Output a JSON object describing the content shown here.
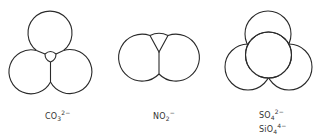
{
  "figure": {
    "type": "space-filling models of oxyanions",
    "panels": [
      {
        "id": "carbonate",
        "geometry": "trigonal planar",
        "label": {
          "base": "CO",
          "sub": "3",
          "sup": "2−"
        },
        "atoms": [
          {
            "element": "O",
            "cx": 50,
            "cy": 33,
            "r": 22
          },
          {
            "element": "O",
            "cx": 30,
            "cy": 68,
            "r": 22
          },
          {
            "element": "O",
            "cx": 71,
            "cy": 68,
            "r": 22
          },
          {
            "element": "C",
            "cx": 50.5,
            "cy": 56,
            "r": 5,
            "note": "central atom visible"
          }
        ]
      },
      {
        "id": "nitrite",
        "geometry": "bent",
        "label": {
          "base": "NO",
          "sub": "2",
          "sup": "−"
        },
        "atoms": [
          {
            "element": "O",
            "cx": 139,
            "cy": 56,
            "r": 23.5
          },
          {
            "element": "O",
            "cx": 179,
            "cy": 56,
            "r": 23.5
          },
          {
            "element": "N",
            "note": "central atom partially visible above"
          }
        ]
      },
      {
        "id": "sulfate-silicate",
        "geometry": "tetrahedral",
        "labels": [
          {
            "base": "SO",
            "sub": "4",
            "sup": "2−"
          },
          {
            "base": "SiO",
            "sub": "4",
            "sup": "4−"
          }
        ],
        "atoms": [
          {
            "element": "O",
            "cx": 268,
            "cy": 34,
            "r": 23
          },
          {
            "element": "O",
            "cx": 248,
            "cy": 67,
            "r": 23
          },
          {
            "element": "O",
            "cx": 289,
            "cy": 67,
            "r": 23
          },
          {
            "element": "O",
            "cx": 268.5,
            "cy": 55,
            "r": 23,
            "note": "front oxygen"
          }
        ]
      }
    ]
  },
  "colors": {
    "stroke": "#2a2a2a",
    "background": "#ffffff",
    "text": "#333333"
  }
}
